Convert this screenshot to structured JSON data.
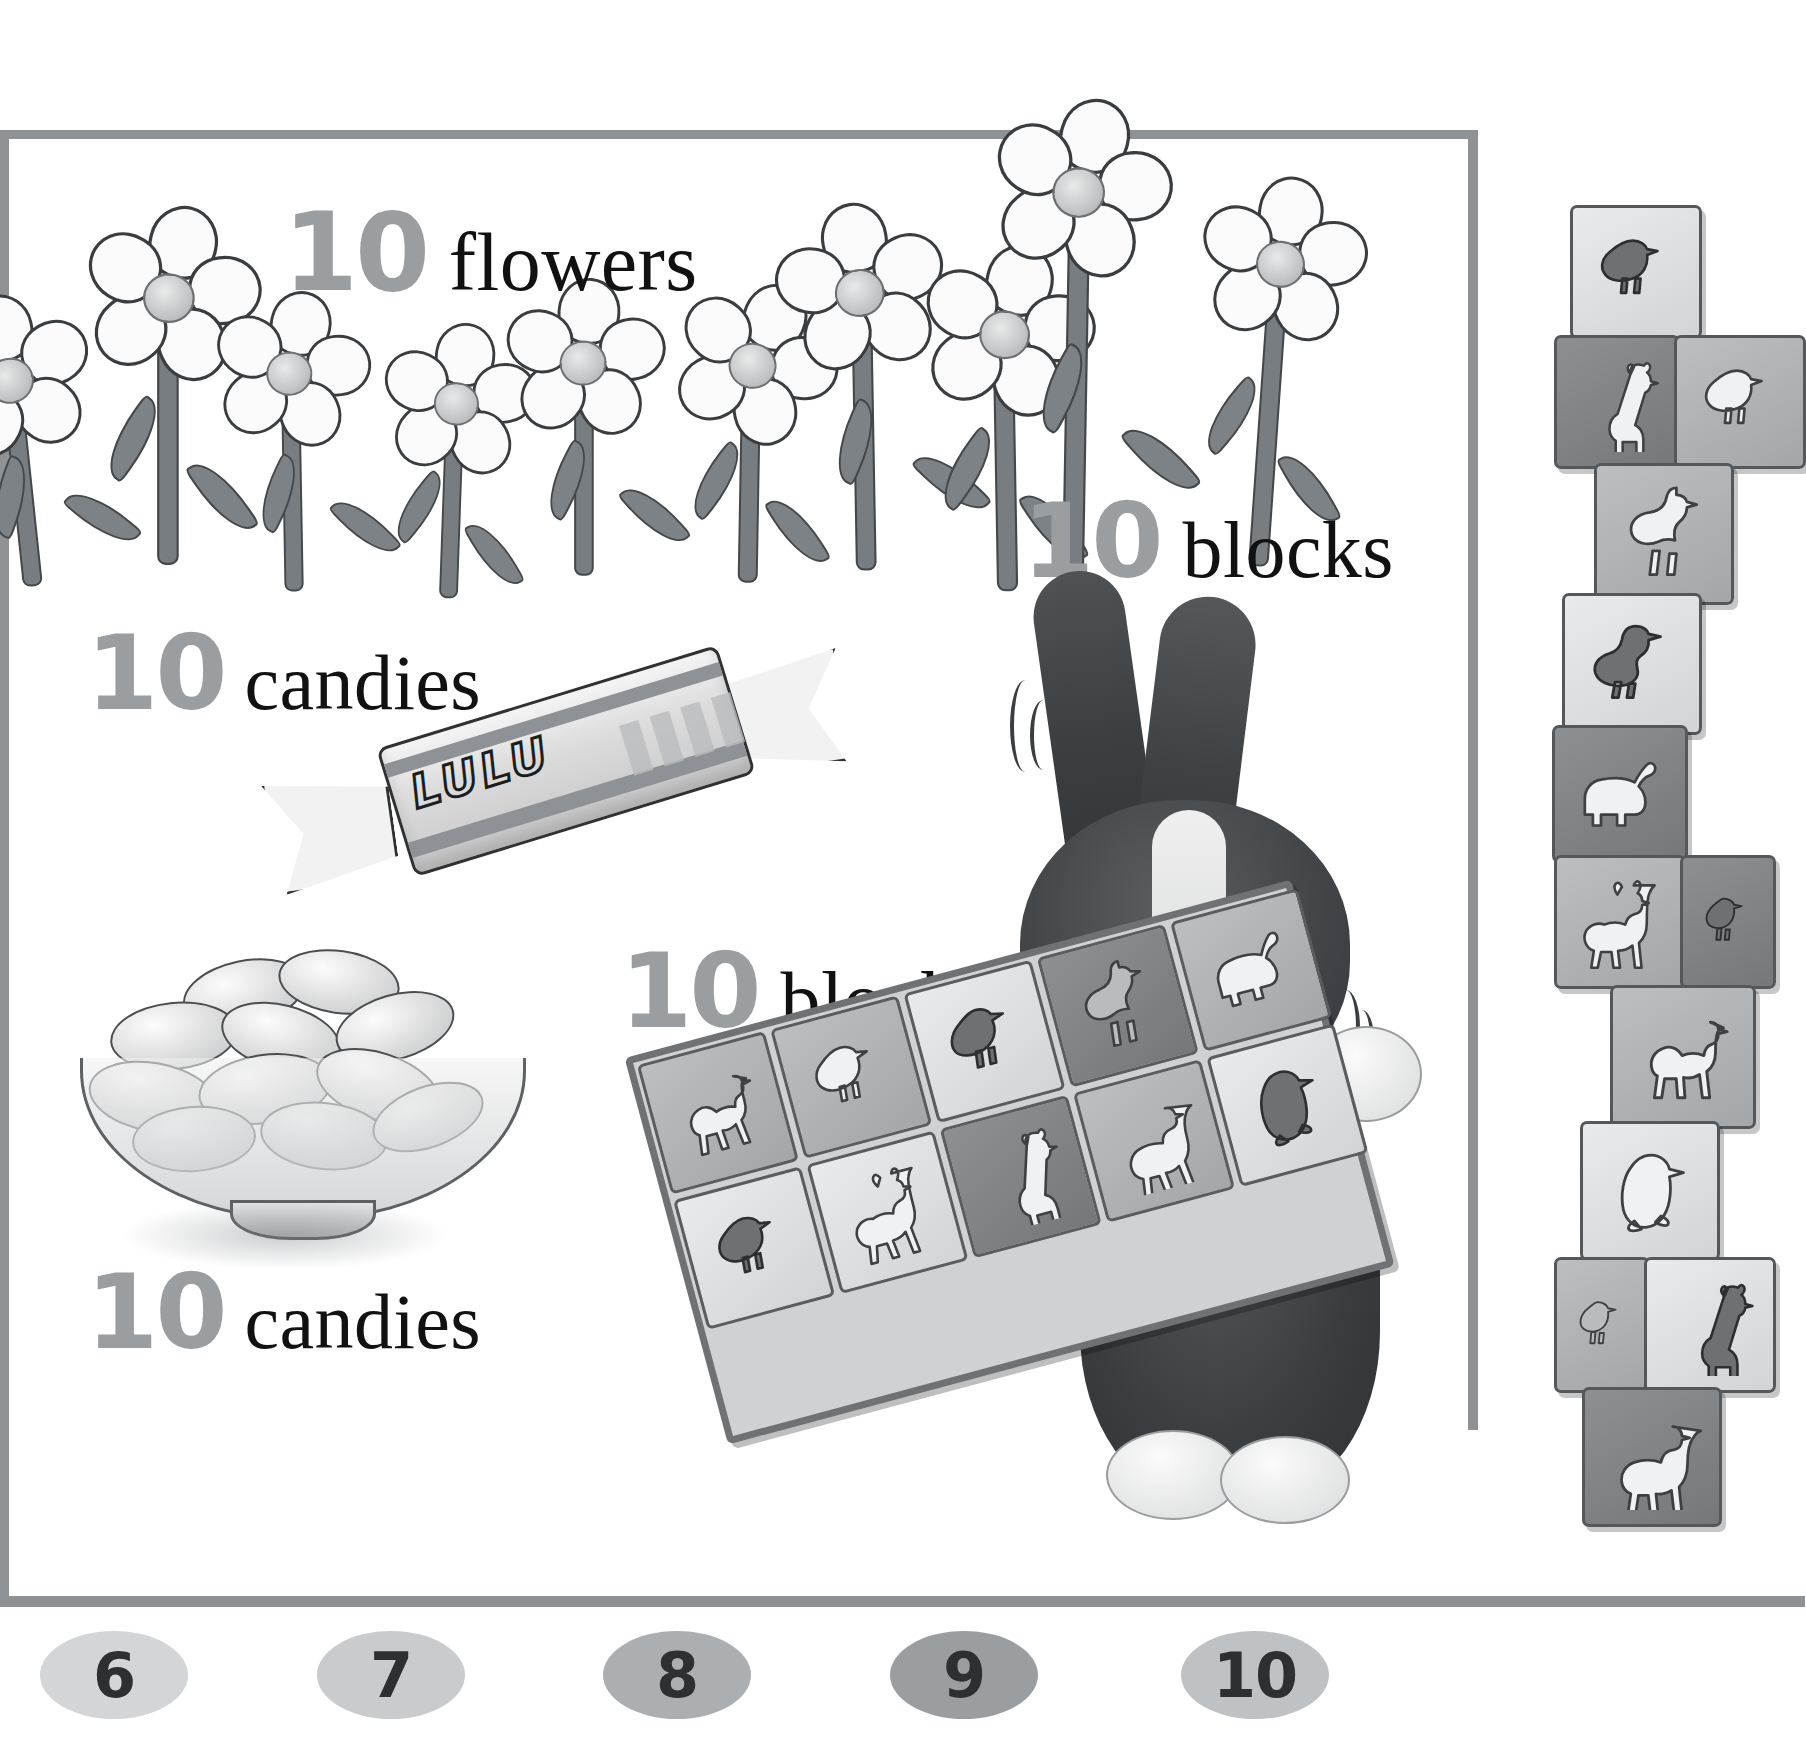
{
  "page": {
    "background_color": "#ffffff",
    "frame_color": "#8e9295",
    "numeral_color": "#9a9ea1",
    "word_color": "#111111"
  },
  "labels": [
    {
      "id": "flowers-top",
      "number": "10",
      "word": "flowers",
      "icon": "flower-icon"
    },
    {
      "id": "blocks-top",
      "number": "10",
      "word": "blocks",
      "icon": "block-icon"
    },
    {
      "id": "candies-top",
      "number": "10",
      "word": "candies",
      "icon": "candy-icon"
    },
    {
      "id": "blocks-mid",
      "number": "10",
      "word": "blocks",
      "icon": "block-icon"
    },
    {
      "id": "candies-bot",
      "number": "10",
      "word": "candies",
      "icon": "candy-icon"
    }
  ],
  "number_strip": {
    "items": [
      {
        "value": "6",
        "chip_color": "#d3d5d7",
        "x": 40
      },
      {
        "value": "7",
        "chip_color": "#c9cbcd",
        "x": 317
      },
      {
        "value": "8",
        "chip_color": "#acafb2",
        "x": 603
      },
      {
        "value": "9",
        "chip_color": "#9b9ea1",
        "x": 890
      },
      {
        "value": "10",
        "chip_color": "#bfc2c4",
        "x": 1181
      }
    ]
  },
  "candy_wrapper": {
    "brand": "LULU",
    "count": 1
  },
  "bowl": {
    "count": 10,
    "label": "bowl-of-candies"
  },
  "flowers": {
    "count": 10,
    "petal_color": "#fbfbfb",
    "center_color": "#c3c5c7",
    "stem_color": "#787d81"
  },
  "rabbit": {
    "label": "rabbit",
    "holding": "block-tray"
  },
  "block_tray": {
    "count": 10,
    "rows": [
      [
        {
          "animal": "camel",
          "tone": "tone-md",
          "figure": "fig-lt"
        },
        {
          "animal": "quail",
          "tone": "tone-md",
          "figure": "fig-lt"
        },
        {
          "animal": "pigeon",
          "tone": "tone-lt",
          "figure": "fig-dk"
        },
        {
          "animal": "ostrich",
          "tone": "tone-dk",
          "figure": "fig-md"
        },
        {
          "animal": "elephant",
          "tone": "tone-md",
          "figure": "fig-lt"
        }
      ],
      [
        {
          "animal": "quail",
          "tone": "tone-lt",
          "figure": "fig-dk"
        },
        {
          "animal": "gazelle",
          "tone": "tone-lt",
          "figure": "fig-lt"
        },
        {
          "animal": "giraffe",
          "tone": "tone-dk",
          "figure": "fig-lt"
        },
        {
          "animal": "lamb",
          "tone": "tone-md",
          "figure": "fig-lt"
        },
        {
          "animal": "penguin",
          "tone": "tone-lt",
          "figure": "fig-dk"
        }
      ]
    ]
  },
  "block_tower": {
    "count": 10,
    "blocks": [
      {
        "animal": "quail",
        "tone": "tone-lt",
        "figure": "fig-dk",
        "y": 10,
        "x": 18,
        "w": 126,
        "h": 128
      },
      {
        "animal": "giraffe",
        "tone": "tone-dk",
        "figure": "fig-lt",
        "y": 140,
        "x": 2,
        "w": 120,
        "h": 128
      },
      {
        "animal": "quail",
        "tone": "tone-md",
        "figure": "fig-lt",
        "y": 140,
        "x": 122,
        "w": 126,
        "h": 128
      },
      {
        "animal": "ostrich",
        "tone": "tone-md",
        "figure": "fig-lt",
        "y": 268,
        "x": 42,
        "w": 134,
        "h": 136
      },
      {
        "animal": "goose",
        "tone": "tone-lt",
        "figure": "fig-dk",
        "y": 398,
        "x": 10,
        "w": 134,
        "h": 136
      },
      {
        "animal": "elephant",
        "tone": "tone-dk",
        "figure": "fig-lt",
        "y": 530,
        "x": 0,
        "w": 130,
        "h": 132
      },
      {
        "animal": "gazelle",
        "tone": "tone-md",
        "figure": "fig-lt",
        "y": 660,
        "x": 2,
        "w": 126,
        "h": 128
      },
      {
        "animal": "bird",
        "tone": "tone-dk",
        "figure": "fig-dk",
        "y": 660,
        "x": 128,
        "w": 90,
        "h": 128
      },
      {
        "animal": "camel",
        "tone": "tone-md",
        "figure": "fig-lt",
        "y": 790,
        "x": 58,
        "w": 140,
        "h": 138
      },
      {
        "animal": "penguin",
        "tone": "tone-lt",
        "figure": "fig-lt",
        "y": 926,
        "x": 28,
        "w": 134,
        "h": 134
      },
      {
        "animal": "bird",
        "tone": "tone-md",
        "figure": "fig-md",
        "y": 1062,
        "x": 2,
        "w": 90,
        "h": 130
      },
      {
        "animal": "giraffe",
        "tone": "tone-lt",
        "figure": "fig-dk",
        "y": 1062,
        "x": 92,
        "w": 126,
        "h": 130
      },
      {
        "animal": "lamb",
        "tone": "tone-dk",
        "figure": "fig-lt",
        "y": 1192,
        "x": 30,
        "w": 134,
        "h": 134
      }
    ]
  }
}
